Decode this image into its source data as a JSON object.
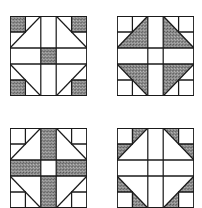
{
  "figure": {
    "colors": {
      "shade": "#8a8a8a",
      "line": "#1a1a1a",
      "background": "#ffffff"
    },
    "blocks": [
      {
        "id": "block-1",
        "position": "top-left",
        "shaded": "corner squares and center square"
      },
      {
        "id": "block-2",
        "position": "top-right",
        "shaded": "large inner corner triangles"
      },
      {
        "id": "block-3",
        "position": "bottom-left",
        "shaded": "center cross bars (not center square)"
      },
      {
        "id": "block-4",
        "position": "bottom-right",
        "shaded": "small outer corner triangles"
      }
    ]
  }
}
